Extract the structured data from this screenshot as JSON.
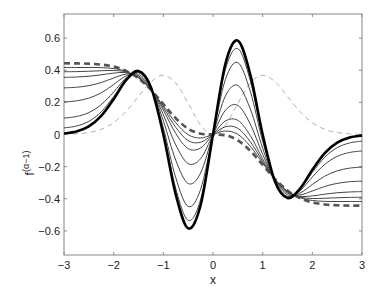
{
  "chart_data": {
    "type": "line",
    "title": "",
    "xlabel": "x",
    "ylabel": "f^(α−1)",
    "ylabel_base": "f",
    "ylabel_sup": "(α−1)",
    "xlim": [
      -3,
      3
    ],
    "ylim": [
      -0.75,
      0.75
    ],
    "xticks": [
      -3,
      -2,
      -1,
      0,
      1,
      2,
      3
    ],
    "yticks": [
      -0.6,
      -0.4,
      -0.2,
      0,
      0.2,
      0.4,
      0.6
    ],
    "xtick_labels": [
      "−3",
      "−2",
      "−1",
      "0",
      "1",
      "2",
      "3"
    ],
    "ytick_labels": [
      "−0.6",
      "−0.4",
      "−0.2",
      "0",
      "0.2",
      "0.4",
      "0.6"
    ],
    "grid": false,
    "legend": null,
    "x": [
      -3,
      -2.75,
      -2.5,
      -2.25,
      -2,
      -1.75,
      -1.5,
      -1.25,
      -1,
      -0.75,
      -0.5,
      -0.25,
      0,
      0.25,
      0.5,
      0.75,
      1,
      1.25,
      1.5,
      1.75,
      2,
      2.25,
      2.5,
      2.75,
      3
    ],
    "series": [
      {
        "name": "alpha=1 (reference, light dashed)",
        "style": "light-dashed",
        "color": "#b0b0b0",
        "width": 1,
        "values": [
          0.0011,
          0.0039,
          0.0121,
          0.032,
          0.0732,
          0.1433,
          0.2372,
          0.3275,
          0.3679,
          0.3205,
          0.1947,
          0.0587,
          0,
          0.0587,
          0.1947,
          0.3205,
          0.3679,
          0.3275,
          0.2372,
          0.1433,
          0.0732,
          0.032,
          0.0121,
          0.0039,
          0.0011
        ]
      },
      {
        "name": "alpha=0 (bold dashed)",
        "style": "bold-dashed",
        "color": "#555555",
        "width": 2.6,
        "values": [
          0.4431,
          0.4424,
          0.4405,
          0.4353,
          0.4227,
          0.3962,
          0.3491,
          0.2779,
          0.1895,
          0.1014,
          0.0359,
          0.005,
          0,
          -0.005,
          -0.0359,
          -0.1014,
          -0.1895,
          -0.2779,
          -0.3491,
          -0.3962,
          -0.4227,
          -0.4353,
          -0.4405,
          -0.4424,
          -0.4431
        ]
      },
      {
        "name": "intermediate 1",
        "style": "solid",
        "color": "#444444",
        "width": 1,
        "values": [
          0.4169,
          0.417,
          0.4171,
          0.4161,
          0.4105,
          0.3927,
          0.3519,
          0.2789,
          0.1781,
          0.0729,
          -0.0013,
          -0.0218,
          0,
          0.0218,
          0.0013,
          -0.0729,
          -0.1781,
          -0.2789,
          -0.3519,
          -0.3927,
          -0.4105,
          -0.4161,
          -0.4171,
          -0.417,
          -0.4169
        ]
      },
      {
        "name": "intermediate 2",
        "style": "solid",
        "color": "#444444",
        "width": 1,
        "values": [
          0.3906,
          0.3915,
          0.3937,
          0.397,
          0.3984,
          0.3892,
          0.3546,
          0.2799,
          0.1668,
          0.0444,
          -0.0385,
          -0.0484,
          0,
          0.0484,
          0.0385,
          -0.0444,
          -0.1668,
          -0.2799,
          -0.3546,
          -0.3892,
          -0.3984,
          -0.397,
          -0.3937,
          -0.3915,
          -0.3906
        ]
      },
      {
        "name": "intermediate 3",
        "style": "solid",
        "color": "#444444",
        "width": 1,
        "values": [
          0.3557,
          0.3577,
          0.3625,
          0.3714,
          0.3821,
          0.3846,
          0.3583,
          0.2813,
          0.1516,
          0.0063,
          -0.0881,
          -0.0841,
          0,
          0.0841,
          0.0881,
          -0.0063,
          -0.1516,
          -0.2813,
          -0.3583,
          -0.3846,
          -0.3821,
          -0.3714,
          -0.3625,
          -0.3577,
          -0.3557
        ]
      },
      {
        "name": "intermediate 4",
        "style": "solid",
        "color": "#444444",
        "width": 1,
        "values": [
          0.2901,
          0.2941,
          0.3041,
          0.3234,
          0.3517,
          0.3758,
          0.3653,
          0.2838,
          0.1232,
          -0.065,
          -0.1811,
          -0.1509,
          0,
          0.1509,
          0.1811,
          0.065,
          -0.1232,
          -0.2838,
          -0.3653,
          -0.3758,
          -0.3517,
          -0.3234,
          -0.3041,
          -0.2941,
          -0.2901
        ]
      },
      {
        "name": "intermediate 5",
        "style": "solid",
        "color": "#444444",
        "width": 1,
        "values": [
          0.2027,
          0.2094,
          0.2261,
          0.2595,
          0.3111,
          0.3641,
          0.3745,
          0.2872,
          0.0853,
          -0.16,
          -0.3051,
          -0.24,
          0,
          0.24,
          0.3051,
          0.16,
          -0.0853,
          -0.2872,
          -0.3745,
          -0.3641,
          -0.3111,
          -0.2595,
          -0.2261,
          -0.2094,
          -0.2027
        ]
      },
      {
        "name": "intermediate 6",
        "style": "solid",
        "color": "#444444",
        "width": 1,
        "values": [
          0.1021,
          0.112,
          0.1364,
          0.186,
          0.2644,
          0.3507,
          0.3851,
          0.2911,
          0.0417,
          -0.2693,
          -0.4477,
          -0.3424,
          0,
          0.3424,
          0.4477,
          0.2693,
          -0.0417,
          -0.2911,
          -0.3851,
          -0.3507,
          -0.2644,
          -0.186,
          -0.1364,
          -0.112,
          -0.1021
        ]
      },
      {
        "name": "intermediate 7",
        "style": "solid",
        "color": "#444444",
        "width": 1,
        "values": [
          0.0409,
          0.0527,
          0.0819,
          0.1413,
          0.236,
          0.3426,
          0.3916,
          0.2934,
          0.0152,
          -0.3359,
          -0.5345,
          -0.405,
          0,
          0.405,
          0.5345,
          0.3359,
          -0.0152,
          -0.2934,
          -0.3916,
          -0.3426,
          -0.236,
          -0.1413,
          -0.0819,
          -0.0527,
          -0.0409
        ]
      },
      {
        "name": "alpha=2 (bold solid)",
        "style": "bold-solid",
        "color": "#000000",
        "width": 2.6,
        "values": [
          0.0059,
          0.0188,
          0.0507,
          0.1157,
          0.2198,
          0.3379,
          0.3953,
          0.2948,
          0,
          -0.3739,
          -0.5841,
          -0.4404,
          0,
          0.4404,
          0.5841,
          0.3739,
          0,
          -0.2948,
          -0.3953,
          -0.3379,
          -0.2198,
          -0.1157,
          -0.0507,
          -0.0188,
          -0.0059
        ]
      }
    ]
  },
  "layout": {
    "plot_left": 64,
    "plot_right": 362,
    "plot_top": 14,
    "plot_bottom": 255,
    "axis_color": "#888888"
  }
}
